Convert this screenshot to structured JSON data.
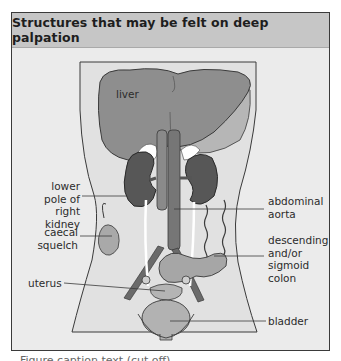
{
  "figure": {
    "title": "Structures that may be felt on deep palpation",
    "labels": {
      "liver": "liver",
      "lower_pole_right_kidney": [
        "lower",
        "pole of right",
        "kidney"
      ],
      "caecal_squelch": [
        "caecal",
        "squelch"
      ],
      "uterus": "uterus",
      "abdominal_aorta": [
        "abdominal",
        "aorta"
      ],
      "descending_sigmoid_colon": [
        "descending",
        "and/or",
        "sigmoid",
        "colon"
      ],
      "bladder": "bladder"
    },
    "colors": {
      "header_bg": "#c6c6c6",
      "panel_bg": "#ebebeb",
      "torso_fill": "#e2e2e2",
      "liver_fill": "#8c8c8c",
      "liver_left_lobe_shadow": "#b4b4b4",
      "kidney_fill": "#5a5a5a",
      "aorta_fill": "#7a7a7a",
      "bowel_fill": "#a8a8a8",
      "bladder_fill": "#b0b0b0",
      "line": "#3a3a3a"
    }
  },
  "caption": {
    "text": "Figure caption text (cut off)"
  }
}
